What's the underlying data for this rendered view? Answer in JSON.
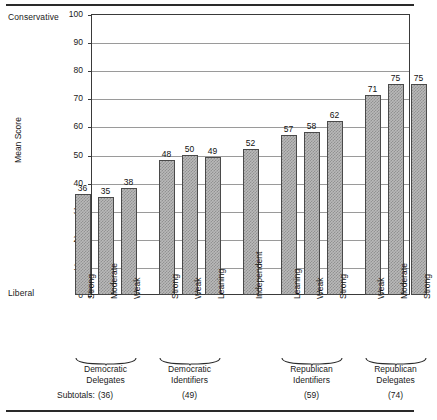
{
  "chart_data": {
    "type": "bar",
    "title": "",
    "xlabel": "",
    "ylabel": "Mean Score",
    "ylim": [
      0,
      100
    ],
    "ytick_values": [
      0,
      10,
      20,
      30,
      40,
      50,
      60,
      70,
      80,
      90,
      100
    ],
    "grid": true,
    "legend": "none",
    "axis_pole_top": "Conservative",
    "axis_pole_bottom": "Liberal",
    "categories": [
      "Strong",
      "Moderate",
      "Weak",
      "Strong",
      "Weak",
      "Leaning",
      "Independent",
      "Leaning",
      "Weak",
      "Strong",
      "Weak",
      "Moderate",
      "Strong"
    ],
    "values": [
      36,
      35,
      38,
      48,
      50,
      49,
      52,
      57,
      58,
      62,
      71,
      75,
      75
    ],
    "groups": [
      {
        "name": "Democratic Delegates",
        "caption_lines": [
          "Democratic",
          "Delegates"
        ],
        "subtotal": "(36)",
        "bar_indices": [
          0,
          1,
          2
        ]
      },
      {
        "name": "Democratic Identifiers",
        "caption_lines": [
          "Democratic",
          "Identifiers"
        ],
        "subtotal": "(49)",
        "bar_indices": [
          3,
          4,
          5
        ]
      },
      {
        "name": "Republican Identifiers",
        "caption_lines": [
          "Republican",
          "Identifiers"
        ],
        "subtotal": "(59)",
        "bar_indices": [
          7,
          8,
          9
        ]
      },
      {
        "name": "Republican Delegates",
        "caption_lines": [
          "Republican",
          "Delegates"
        ],
        "subtotal": "(74)",
        "bar_indices": [
          10,
          11,
          12
        ]
      }
    ],
    "ungrouped_bar": {
      "category": "Independent",
      "value": 52,
      "index": 6
    }
  },
  "subtotals_row_label": "Subtotals:",
  "colors": {
    "bar_fill": "#b9b9b9",
    "bar_edge": "#4a4a4a",
    "grid": "#9a9a9a",
    "axis": "#3a3a3a",
    "text": "#1a1a1a",
    "background": "#ffffff"
  }
}
